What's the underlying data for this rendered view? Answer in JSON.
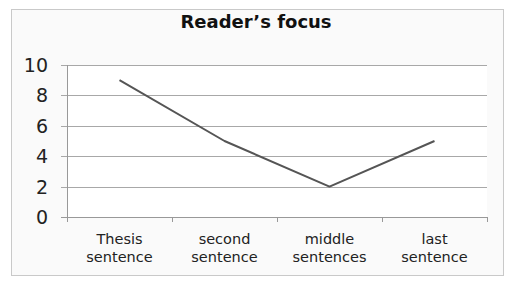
{
  "chart_data": {
    "type": "line",
    "title": "Reader’s focus",
    "xlabel": "",
    "ylabel": "",
    "categories": [
      "Thesis sentence",
      "second sentence",
      "middle sentences",
      "last sentence"
    ],
    "category_lines": [
      [
        "Thesis",
        "sentence"
      ],
      [
        "second",
        "sentence"
      ],
      [
        "middle",
        "sentences"
      ],
      [
        "last",
        "sentence"
      ]
    ],
    "series": [
      {
        "name": "Reader's focus",
        "values": [
          9,
          5,
          2,
          5
        ],
        "color": "#555555"
      }
    ],
    "ylim": [
      0,
      10
    ],
    "yticks": [
      "0",
      "2",
      "4",
      "6",
      "8",
      "10"
    ],
    "grid": true,
    "legend": "none"
  }
}
